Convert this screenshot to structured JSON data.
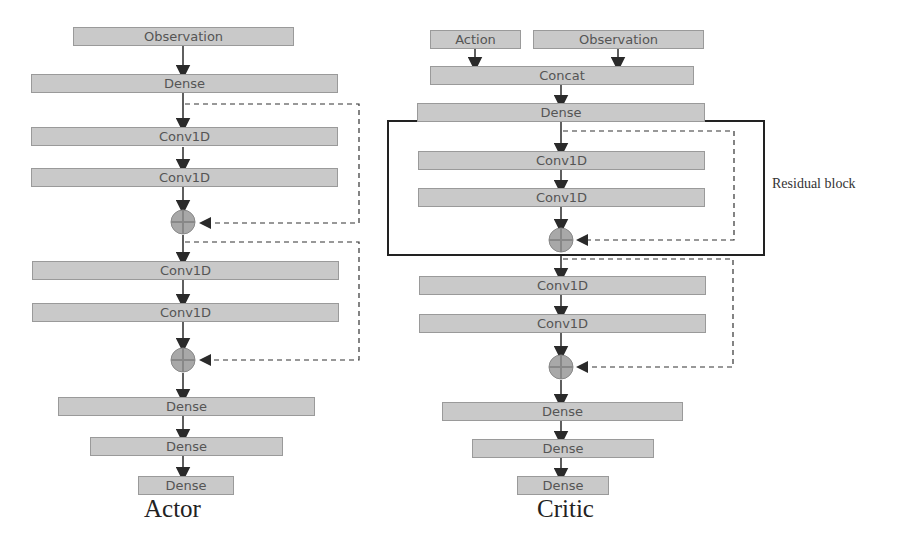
{
  "actor": {
    "caption": "Actor",
    "layers": [
      "Observation",
      "Dense",
      "Conv1D",
      "Conv1D",
      "Conv1D",
      "Conv1D",
      "Dense",
      "Dense",
      "Dense"
    ]
  },
  "critic": {
    "caption": "Critic",
    "inputs": [
      "Action",
      "Observation"
    ],
    "layers": [
      "Concat",
      "Dense",
      "Conv1D",
      "Conv1D",
      "Conv1D",
      "Conv1D",
      "Dense",
      "Dense",
      "Dense"
    ]
  },
  "annotation": {
    "residual_block_label": "Residual block"
  },
  "colors": {
    "layer_fill": "#c9c9c9",
    "layer_border": "#9a9a9a",
    "arrow": "#2a2a2a",
    "adder_fill": "#a8a8a8"
  }
}
